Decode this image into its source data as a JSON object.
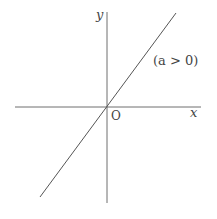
{
  "diagram": {
    "type": "coordinate-graph",
    "colors": {
      "axis": "#6e6e6e",
      "line": "#555555",
      "text": "#444444",
      "background": "#ffffff"
    },
    "axes": {
      "x_label": "x",
      "y_label": "y",
      "origin_label": "O",
      "origin_px": [
        107,
        107
      ],
      "x_axis_px": {
        "from": [
          15,
          107
        ],
        "to": [
          201,
          107
        ]
      },
      "y_axis_px": {
        "from": [
          107,
          12
        ],
        "to": [
          107,
          203
        ]
      }
    },
    "line": {
      "equation": "y = ax",
      "condition_label": "(a > 0)",
      "from_px": [
        40,
        197
      ],
      "to_px": [
        176,
        13
      ]
    }
  }
}
